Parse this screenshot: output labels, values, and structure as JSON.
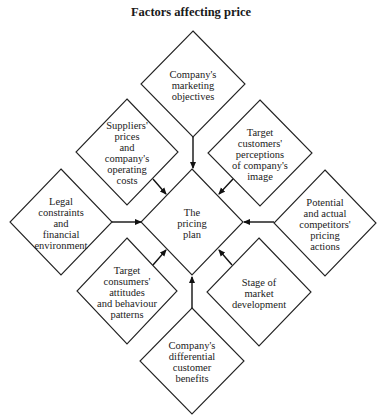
{
  "title": "Factors affecting price",
  "center": {
    "id": "pricing-plan",
    "lines": [
      "The",
      "pricing",
      "plan"
    ],
    "cx": 192,
    "cy": 222,
    "hw": 51,
    "hh": 53
  },
  "factors": [
    {
      "id": "marketing-objectives",
      "lines": [
        "Company's",
        "marketing",
        "objectives"
      ],
      "cx": 193,
      "cy": 84,
      "hw": 52,
      "hh": 53
    },
    {
      "id": "suppliers-prices",
      "lines": [
        "Suppliers'",
        "prices",
        "and",
        "company's",
        "operating",
        "costs"
      ],
      "cx": 127,
      "cy": 152,
      "hw": 51,
      "hh": 53
    },
    {
      "id": "target-customers-perceptions",
      "lines": [
        "Target",
        "customers'",
        "perceptions",
        "of company's",
        "image"
      ],
      "cx": 260,
      "cy": 153,
      "hw": 52,
      "hh": 53
    },
    {
      "id": "legal-constraints",
      "lines": [
        "Legal",
        "constraints",
        "and",
        "financial",
        "environment"
      ],
      "cx": 61,
      "cy": 222,
      "hw": 51,
      "hh": 53
    },
    {
      "id": "competitors-pricing",
      "lines": [
        "Potential",
        "and actual",
        "competitors'",
        "pricing",
        "actions"
      ],
      "cx": 325,
      "cy": 223,
      "hw": 51,
      "hh": 53
    },
    {
      "id": "target-consumers-attitudes",
      "lines": [
        "Target",
        "consumers'",
        "attitudes",
        "and behaviour",
        "patterns"
      ],
      "cx": 127,
      "cy": 291,
      "hw": 50,
      "hh": 53
    },
    {
      "id": "stage-market-development",
      "lines": [
        "Stage of",
        "market",
        "development"
      ],
      "cx": 259,
      "cy": 292,
      "hw": 52,
      "hh": 54
    },
    {
      "id": "differential-benefits",
      "lines": [
        "Company's",
        "differential",
        "customer",
        "benefits"
      ],
      "cx": 192,
      "cy": 361,
      "hw": 52,
      "hh": 53
    }
  ],
  "arrows": [
    {
      "from": "marketing-objectives",
      "x1": 193,
      "y1": 137,
      "x2": 193,
      "y2": 168
    },
    {
      "from": "suppliers-prices",
      "x1": 153,
      "y1": 179,
      "x2": 166,
      "y2": 194
    },
    {
      "from": "target-customers-perceptions",
      "x1": 233,
      "y1": 179,
      "x2": 219,
      "y2": 194
    },
    {
      "from": "legal-constraints",
      "x1": 112,
      "y1": 222,
      "x2": 141,
      "y2": 222
    },
    {
      "from": "competitors-pricing",
      "x1": 274,
      "y1": 222,
      "x2": 244,
      "y2": 222
    },
    {
      "from": "target-consumers-attitudes",
      "x1": 153,
      "y1": 265,
      "x2": 166,
      "y2": 250
    },
    {
      "from": "stage-market-development",
      "x1": 232,
      "y1": 265,
      "x2": 219,
      "y2": 250
    },
    {
      "from": "differential-benefits",
      "x1": 192,
      "y1": 308,
      "x2": 192,
      "y2": 277
    }
  ]
}
